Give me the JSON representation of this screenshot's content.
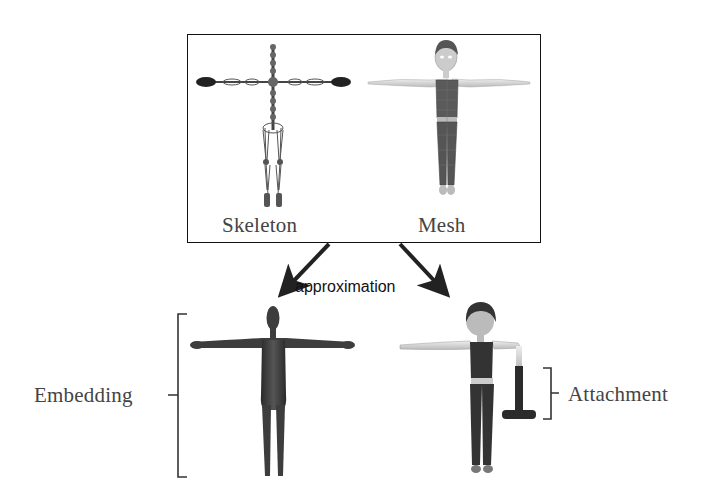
{
  "diagram": {
    "top_panel": {
      "left_label": "Skeleton",
      "right_label": "Mesh"
    },
    "arrow_label": "approximation",
    "bottom": {
      "left_label": "Embedding",
      "right_label": "Attachment"
    }
  },
  "colors": {
    "border": "#111111",
    "figure_dark": "#3a3a3a",
    "skin_light": "#d8d8d8",
    "text": "#444444"
  }
}
